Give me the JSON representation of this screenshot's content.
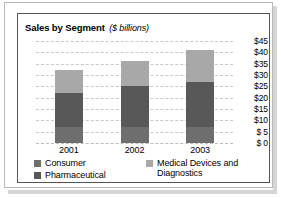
{
  "chart_data": {
    "type": "bar",
    "subtype": "stacked-bar",
    "title": "Sales by Segment",
    "title_units": "($ billions)",
    "xlabel": "",
    "ylabel": "",
    "categories": [
      "2001",
      "2002",
      "2003"
    ],
    "series": [
      {
        "name": "Consumer",
        "color": "#6e6e6e",
        "values": [
          7,
          7,
          7
        ]
      },
      {
        "name": "Pharmaceutical",
        "color": "#585858",
        "values": [
          15,
          18,
          20
        ]
      },
      {
        "name": "Medical Devices and Diagnostics",
        "color": "#a8a8a8",
        "values": [
          10,
          11,
          14
        ]
      }
    ],
    "totals": [
      32,
      36,
      41
    ],
    "ylim": [
      0,
      45
    ],
    "ytick_values": [
      45,
      40,
      35,
      30,
      25,
      20,
      15,
      10,
      5,
      0
    ],
    "ytick_labels": [
      "$45",
      "$40",
      "$35",
      "$30",
      "$25",
      "$20",
      "$15",
      "$10",
      "$ 5",
      "$ 0"
    ],
    "grid": true,
    "grid_style": "dashed",
    "axis_position": "right",
    "legend_position": "bottom"
  },
  "legend": {
    "left_column": [
      {
        "label": "Consumer",
        "color": "#6e6e6e"
      },
      {
        "label": "Pharmaceutical",
        "color": "#585858"
      }
    ],
    "right_column": [
      {
        "label": "Medical Devices and\nDiagnostics",
        "color": "#a8a8a8"
      }
    ]
  },
  "colors": {
    "medical_devices": "#a8a8a8",
    "pharmaceutical": "#585858",
    "consumer": "#6e6e6e",
    "gridline": "#c9c9c9",
    "panel_border": "#555555",
    "frame_border": "#b8b8b8",
    "shadow": "#d6d6d6"
  }
}
